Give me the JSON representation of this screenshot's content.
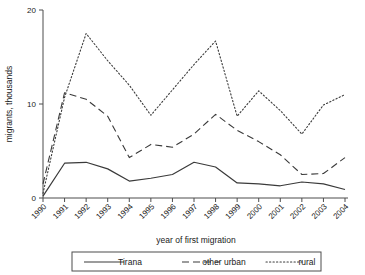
{
  "chart_data": {
    "type": "line",
    "title": "",
    "xlabel": "year of first migration",
    "ylabel": "migrants, thousands",
    "x": [
      1990,
      1991,
      1992,
      1993,
      1994,
      1995,
      1996,
      1997,
      1998,
      1999,
      2000,
      2001,
      2002,
      2003,
      2004
    ],
    "xtick_labels": [
      "1990",
      "1991",
      "1992",
      "1993",
      "1994",
      "1995",
      "1996",
      "1997",
      "1998",
      "1999",
      "2000",
      "2001",
      "2002",
      "2003",
      "2004"
    ],
    "ytick_labels": [
      "0",
      "10",
      "20"
    ],
    "yticks": [
      0,
      10,
      20
    ],
    "ylim": [
      0,
      20
    ],
    "xlim": [
      1990,
      2004
    ],
    "grid": false,
    "legend_position": "bottom",
    "series": [
      {
        "name": "Tirana",
        "style": "solid",
        "values": [
          0.2,
          3.7,
          3.8,
          3.1,
          1.8,
          2.1,
          2.5,
          3.8,
          3.3,
          1.6,
          1.5,
          1.3,
          1.7,
          1.5,
          0.9
        ]
      },
      {
        "name": "other urban",
        "style": "dashed",
        "values": [
          1.5,
          11.2,
          10.5,
          8.7,
          4.3,
          5.7,
          5.4,
          6.8,
          8.9,
          7.2,
          6.0,
          4.6,
          2.5,
          2.6,
          4.3
        ]
      },
      {
        "name": "rural",
        "style": "dotted",
        "values": [
          0.5,
          10.7,
          17.5,
          14.6,
          12.0,
          8.8,
          11.5,
          14.2,
          16.7,
          8.7,
          11.4,
          9.3,
          6.8,
          9.9,
          11.0
        ]
      }
    ]
  },
  "legend": {
    "items": [
      {
        "label": "Tirana",
        "style": "solid"
      },
      {
        "label": "other urban",
        "style": "dashed"
      },
      {
        "label": "rural",
        "style": "dotted"
      }
    ]
  },
  "colors": {
    "line": "#3a3a3a",
    "axis": "#4d4d4d",
    "text": "#1a1a1a",
    "background": "#ffffff"
  }
}
